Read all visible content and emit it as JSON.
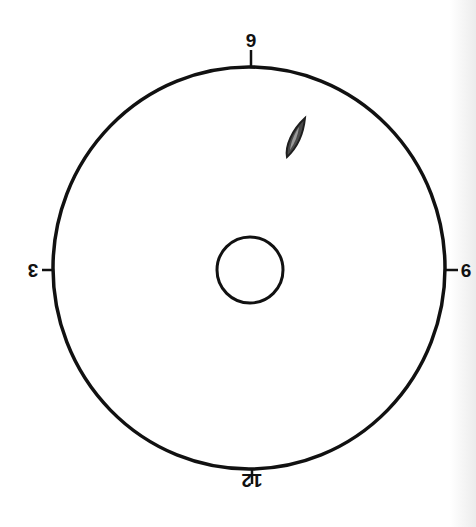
{
  "diagram": {
    "type": "clock-face-position-diagram",
    "outer_circle": {
      "cx": 249,
      "cy": 268,
      "rx": 196,
      "ry": 201,
      "stroke": "#111111"
    },
    "inner_circle": {
      "cx": 250,
      "cy": 270,
      "r": 33,
      "stroke": "#111111"
    },
    "labels": {
      "top": "9",
      "bottom": "12",
      "left": "3",
      "right": "6"
    },
    "marker": {
      "name": "lesion-marker",
      "approx_position": "between 9 and 6 o'clock, upper right",
      "fill": "#555555",
      "outline": "#222222"
    },
    "colors": {
      "line": "#111111",
      "background": "#ffffff"
    }
  }
}
